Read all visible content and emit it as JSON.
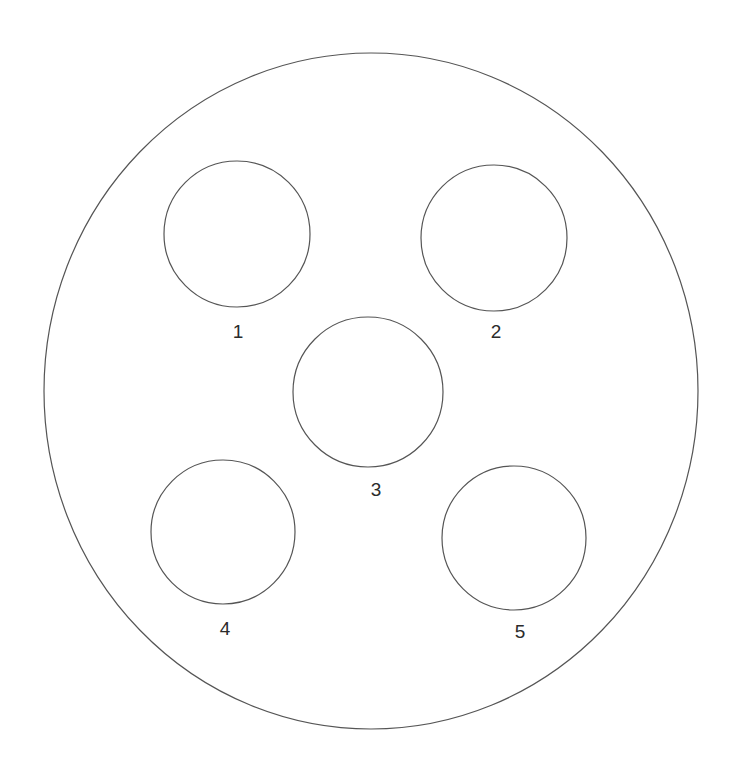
{
  "figure": {
    "type": "technical-line-drawing",
    "background_color": "#ffffff",
    "stroke_color": "#555555",
    "label_color": "#2b2b2b",
    "stroke_width": 1.2,
    "canvas": {
      "width": 732,
      "height": 775
    }
  },
  "outer_boundary": {
    "name": "plate-outline",
    "shape": "ellipse",
    "cx": 371,
    "cy": 391,
    "rx": 327,
    "ry": 338
  },
  "holes": [
    {
      "label": "1",
      "name": "hole-1",
      "cx": 237,
      "cy": 234,
      "r": 73,
      "label_x": 238,
      "label_y": 338
    },
    {
      "label": "2",
      "name": "hole-2",
      "cx": 494,
      "cy": 238,
      "r": 73,
      "label_x": 496,
      "label_y": 338
    },
    {
      "label": "3",
      "name": "hole-3",
      "cx": 368,
      "cy": 392,
      "r": 75,
      "label_x": 376,
      "label_y": 496
    },
    {
      "label": "4",
      "name": "hole-4",
      "cx": 223,
      "cy": 532,
      "r": 72,
      "label_x": 225,
      "label_y": 635
    },
    {
      "label": "5",
      "name": "hole-5",
      "cx": 514,
      "cy": 538,
      "r": 72,
      "label_x": 520,
      "label_y": 638
    }
  ],
  "labels": {
    "hole_1": "1",
    "hole_2": "2",
    "hole_3": "3",
    "hole_4": "4",
    "hole_5": "5"
  }
}
